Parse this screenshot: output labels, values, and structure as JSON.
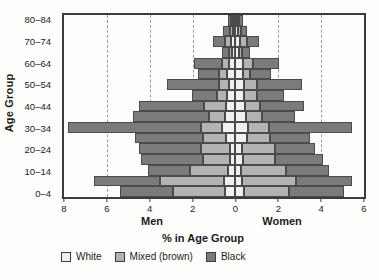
{
  "figure": {
    "y_axis_title": "Age Group",
    "x_axis_title": "% in Age Group",
    "men_label": "Men",
    "women_label": "Women"
  },
  "legend": {
    "items": [
      {
        "key": "white",
        "label": "White",
        "color": "#f1f0ee"
      },
      {
        "key": "mixed",
        "label": "Mixed (brown)",
        "color": "#b4b3b1"
      },
      {
        "key": "black",
        "label": "Black",
        "color": "#7c7b79"
      }
    ]
  },
  "chart_data": {
    "type": "bar",
    "subtype": "population-pyramid-stacked-horizontal",
    "title": "",
    "xlabel": "% in Age Group",
    "ylabel": "Age Group",
    "x_tick_values": [
      -8,
      -6,
      -4,
      -2,
      0,
      2,
      4,
      6
    ],
    "x_tick_labels": [
      "8",
      "6",
      "4",
      "2",
      "0",
      "2",
      "4",
      "6"
    ],
    "xlim": [
      -8,
      6
    ],
    "gridline_values": [
      -6,
      -4,
      -2,
      2,
      4
    ],
    "grid_style": "dashed-vertical",
    "stack_order_from_center": [
      "white",
      "mixed",
      "black"
    ],
    "age_groups": [
      "0–4",
      "5–9",
      "10–14",
      "15–19",
      "20–24",
      "25–29",
      "30–34",
      "35–39",
      "40–44",
      "45–49",
      "50–54",
      "55–59",
      "60–64",
      "65–69",
      "70–74",
      "75–79",
      "80–84"
    ],
    "y_tick_labels_shown_top_to_bottom": [
      "80–84",
      "70–74",
      "60–64",
      "50–54",
      "40–44",
      "30–34",
      "20–24",
      "10–14",
      "0–4"
    ],
    "units": "% in age group",
    "men": {
      "white": [
        0.5,
        0.55,
        0.35,
        0.25,
        0.25,
        0.45,
        0.65,
        0.5,
        0.45,
        0.4,
        0.3,
        0.4,
        0.3,
        0.15,
        0.2,
        0.1,
        0.05
      ],
      "mixed": [
        2.4,
        2.95,
        1.75,
        1.25,
        1.35,
        1.05,
        0.95,
        0.75,
        1.0,
        0.45,
        0.45,
        0.35,
        0.35,
        0.15,
        0.3,
        0.15,
        0.05
      ],
      "black": [
        2.5,
        3.1,
        2.0,
        2.9,
        2.9,
        3.2,
        6.2,
        3.55,
        3.05,
        1.2,
        2.45,
        1.0,
        1.3,
        0.35,
        0.55,
        0.35,
        0.15
      ]
    },
    "women": {
      "white": [
        0.4,
        0.3,
        0.25,
        0.35,
        0.3,
        0.55,
        0.6,
        0.5,
        0.45,
        0.4,
        0.4,
        0.35,
        0.35,
        0.15,
        0.2,
        0.1,
        0.05
      ],
      "mixed": [
        2.1,
        2.55,
        2.1,
        1.5,
        1.55,
        1.05,
        0.95,
        0.75,
        0.7,
        0.6,
        0.6,
        0.35,
        0.45,
        0.15,
        0.35,
        0.15,
        0.05
      ],
      "black": [
        2.55,
        2.6,
        2.0,
        2.25,
        1.85,
        1.9,
        3.9,
        1.55,
        2.05,
        1.25,
        2.1,
        0.95,
        1.25,
        0.4,
        0.55,
        0.3,
        0.15
      ]
    }
  }
}
